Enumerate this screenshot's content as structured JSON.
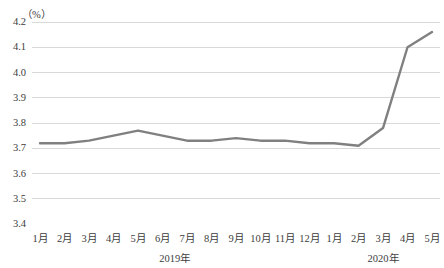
{
  "chart_data": {
    "type": "line",
    "title": "",
    "subtitle": "",
    "unit_label": "（%）",
    "xlabel": "",
    "ylabel": "",
    "ylim": [
      3.4,
      4.2
    ],
    "ytick_labels": [
      "4.2",
      "4.1",
      "4.0",
      "3.9",
      "3.8",
      "3.7",
      "3.6",
      "3.5",
      "3.4"
    ],
    "ytick_values": [
      4.2,
      4.1,
      4.0,
      3.9,
      3.8,
      3.7,
      3.6,
      3.5,
      3.4
    ],
    "grid": true,
    "legend": "none",
    "line_color": "#808080",
    "grid_color": "#d9d9d9",
    "categories": [
      "1月",
      "2月",
      "3月",
      "4月",
      "5月",
      "6月",
      "7月",
      "8月",
      "9月",
      "10月",
      "11月",
      "12月",
      "1月",
      "2月",
      "3月",
      "4月",
      "5月"
    ],
    "group_labels": [
      "2019年",
      "2020年"
    ],
    "series": [
      {
        "name": "失业率",
        "values": [
          3.72,
          3.72,
          3.73,
          3.75,
          3.77,
          3.75,
          3.73,
          3.73,
          3.74,
          3.73,
          3.73,
          3.72,
          3.72,
          3.71,
          3.78,
          4.1,
          4.16
        ]
      }
    ]
  }
}
